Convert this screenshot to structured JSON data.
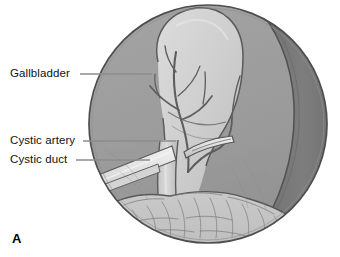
{
  "figure": {
    "letter": "A",
    "type": "medical-illustration",
    "view": "circular laparoscope field of view",
    "palette": {
      "background": "#ffffff",
      "field_peritoneum": "#9d9d9d",
      "liver_dark": "#7a7a7a",
      "gallbladder_light": "#c9c9c9",
      "gallbladder_highlight": "#d8d8d8",
      "omentum_fat": "#c2c2c2",
      "instrument_metal": "#e2e2e2",
      "outline": "#4a4a4a",
      "leader_line": "#8d8d8d",
      "label_text": "#111111"
    }
  },
  "labels": [
    {
      "id": "gallbladder",
      "text": "Gallbladder",
      "leader": {
        "x1": 80,
        "y1": 74,
        "x2": 152,
        "y2": 74
      }
    },
    {
      "id": "cystic-artery",
      "text": "Cystic artery",
      "leader": {
        "x1": 83,
        "y1": 141,
        "x2": 176,
        "y2": 141
      }
    },
    {
      "id": "cystic-duct",
      "text": "Cystic duct",
      "leader": {
        "x1": 76,
        "y1": 160,
        "x2": 150,
        "y2": 160
      }
    }
  ],
  "scene": {
    "circle": {
      "cx": 208,
      "cy": 124,
      "r": 119
    },
    "structures": [
      {
        "name": "gallbladder",
        "shade": "light"
      },
      {
        "name": "liver-edge",
        "shade": "dark"
      },
      {
        "name": "cystic-artery-branches",
        "shade": "outline"
      },
      {
        "name": "cystic-duct",
        "shade": "light"
      },
      {
        "name": "omentum",
        "shade": "textured"
      },
      {
        "name": "grasper-instrument",
        "shade": "metal"
      },
      {
        "name": "dissector-instrument",
        "shade": "metal"
      }
    ]
  }
}
